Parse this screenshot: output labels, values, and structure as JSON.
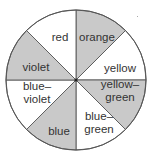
{
  "diagram": {
    "type": "color-wheel",
    "center": [
      76,
      80
    ],
    "radius": 70,
    "colors": {
      "shaded": "#c9c9c9",
      "unshaded": "#ffffff",
      "line": "#555555"
    },
    "sectors": [
      {
        "name": "orange",
        "lines": [
          "orange"
        ],
        "start_deg": 0,
        "end_deg": 45,
        "shaded": true,
        "label_pos": [
          97,
          37
        ]
      },
      {
        "name": "yellow",
        "lines": [
          "yellow"
        ],
        "start_deg": 45,
        "end_deg": 90,
        "shaded": false,
        "label_pos": [
          120,
          68
        ]
      },
      {
        "name": "yellow-green",
        "lines": [
          "yellow–",
          "green"
        ],
        "start_deg": 90,
        "end_deg": 135,
        "shaded": true,
        "label_pos": [
          120,
          90
        ]
      },
      {
        "name": "blue-green",
        "lines": [
          "blue–",
          "green"
        ],
        "start_deg": 135,
        "end_deg": 180,
        "shaded": false,
        "label_pos": [
          99,
          122
        ]
      },
      {
        "name": "blue",
        "lines": [
          "blue"
        ],
        "start_deg": 180,
        "end_deg": 225,
        "shaded": true,
        "label_pos": [
          59,
          131
        ]
      },
      {
        "name": "blue-violet",
        "lines": [
          "blue–",
          "violet"
        ],
        "start_deg": 225,
        "end_deg": 270,
        "shaded": false,
        "label_pos": [
          37,
          92
        ]
      },
      {
        "name": "violet",
        "lines": [
          "violet"
        ],
        "start_deg": 270,
        "end_deg": 315,
        "shaded": true,
        "label_pos": [
          36,
          67
        ]
      },
      {
        "name": "red",
        "lines": [
          "red"
        ],
        "start_deg": 315,
        "end_deg": 360,
        "shaded": false,
        "label_pos": [
          60,
          37
        ]
      }
    ]
  }
}
